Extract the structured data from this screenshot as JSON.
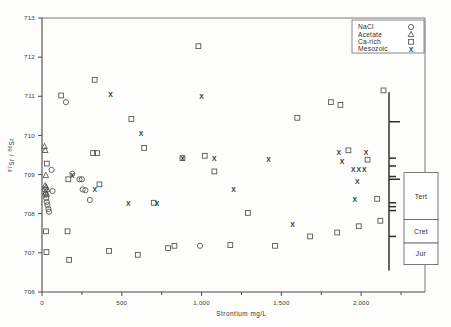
{
  "chart_data": {
    "type": "scatter",
    "title": "",
    "xlabel": "Strontium  mg/L",
    "ylabel": "87Sr / 86Sr",
    "xlim": [
      0,
      2400
    ],
    "ylim": [
      706,
      713
    ],
    "grid": false,
    "ylabel_numerator": "87",
    "ylabel_sr1": "Sr",
    "ylabel_slash": "/",
    "ylabel_denominator": "86",
    "ylabel_sr2": "Sr",
    "xticks": [
      0,
      500,
      1000,
      1500,
      2000
    ],
    "xtick_labels": [
      "0",
      "500",
      "1,000",
      "1,500",
      "2,000"
    ],
    "xminor_ticks": [
      250,
      750,
      1250,
      1750,
      2250
    ],
    "yticks": [
      706,
      707,
      708,
      709,
      710,
      711,
      712,
      713
    ],
    "ytick_labels": [
      "706",
      "707",
      "708",
      "709",
      "710",
      "711",
      "712",
      "713"
    ],
    "legend_position": "top-right",
    "legend_title": "",
    "series": [
      {
        "name": "NaCl",
        "marker": "circle",
        "points": [
          [
            18,
            708.62
          ],
          [
            22,
            708.48
          ],
          [
            26,
            708.4
          ],
          [
            30,
            708.3
          ],
          [
            34,
            708.22
          ],
          [
            40,
            708.12
          ],
          [
            44,
            708.05
          ],
          [
            60,
            709.12
          ],
          [
            66,
            708.58
          ],
          [
            150,
            710.85
          ],
          [
            190,
            709.02
          ],
          [
            235,
            708.88
          ],
          [
            250,
            708.88
          ],
          [
            255,
            708.62
          ],
          [
            272,
            708.6
          ],
          [
            300,
            708.35
          ],
          [
            990,
            707.18
          ]
        ]
      },
      {
        "name": "Acetate",
        "marker": "triangle",
        "points": [
          [
            16,
            709.72
          ],
          [
            20,
            709.62
          ],
          [
            24,
            708.98
          ],
          [
            20,
            708.72
          ],
          [
            26,
            708.68
          ],
          [
            32,
            708.62
          ],
          [
            22,
            708.55
          ],
          [
            30,
            708.5
          ]
        ]
      },
      {
        "name": "Ca-rich",
        "marker": "square",
        "points": [
          [
            30,
            709.28
          ],
          [
            25,
            707.55
          ],
          [
            28,
            707.02
          ],
          [
            120,
            711.02
          ],
          [
            160,
            707.55
          ],
          [
            165,
            708.88
          ],
          [
            170,
            706.82
          ],
          [
            320,
            709.55
          ],
          [
            345,
            709.55
          ],
          [
            330,
            711.42
          ],
          [
            360,
            708.75
          ],
          [
            420,
            707.05
          ],
          [
            560,
            710.42
          ],
          [
            600,
            706.95
          ],
          [
            640,
            709.68
          ],
          [
            700,
            708.28
          ],
          [
            790,
            707.12
          ],
          [
            830,
            707.18
          ],
          [
            880,
            709.42
          ],
          [
            980,
            712.28
          ],
          [
            1020,
            709.48
          ],
          [
            1080,
            709.08
          ],
          [
            1180,
            707.2
          ],
          [
            1290,
            708.02
          ],
          [
            1460,
            707.18
          ],
          [
            1600,
            710.45
          ],
          [
            1680,
            707.42
          ],
          [
            1810,
            710.85
          ],
          [
            1870,
            710.78
          ],
          [
            1850,
            707.52
          ],
          [
            1920,
            709.62
          ],
          [
            1985,
            707.68
          ],
          [
            2040,
            709.38
          ],
          [
            2100,
            708.38
          ],
          [
            2120,
            707.82
          ],
          [
            2140,
            711.15
          ]
        ]
      },
      {
        "name": "Mesozoic",
        "marker": "x",
        "points": [
          [
            190,
            708.98
          ],
          [
            330,
            708.62
          ],
          [
            430,
            711.05
          ],
          [
            540,
            708.25
          ],
          [
            620,
            710.05
          ],
          [
            720,
            708.25
          ],
          [
            880,
            709.42
          ],
          [
            1000,
            710.98
          ],
          [
            1080,
            709.42
          ],
          [
            1200,
            708.62
          ],
          [
            1420,
            709.38
          ],
          [
            1570,
            707.72
          ],
          [
            1860,
            709.55
          ],
          [
            1880,
            709.32
          ],
          [
            1950,
            709.12
          ],
          [
            1985,
            709.12
          ],
          [
            2020,
            709.12
          ],
          [
            1975,
            708.82
          ],
          [
            1960,
            708.35
          ],
          [
            2030,
            709.55
          ]
        ]
      }
    ],
    "margin_axis": {
      "description": "marginal stratigraphic seawater curve ticks",
      "ticks": [
        710.35,
        709.42,
        709.22,
        708.95,
        708.88,
        708.28,
        708.18,
        708.08,
        707.42
      ]
    },
    "era_boxes": [
      {
        "label": "Tert"
      },
      {
        "label": "Cret"
      },
      {
        "label": "Jur"
      }
    ]
  },
  "legend": {
    "entries": [
      {
        "label": "NaCl",
        "marker": "circle"
      },
      {
        "label": "Acetate",
        "marker": "triangle"
      },
      {
        "label": "Ca-rich",
        "marker": "square"
      },
      {
        "label": "Mesozoic",
        "marker": "X"
      }
    ]
  }
}
